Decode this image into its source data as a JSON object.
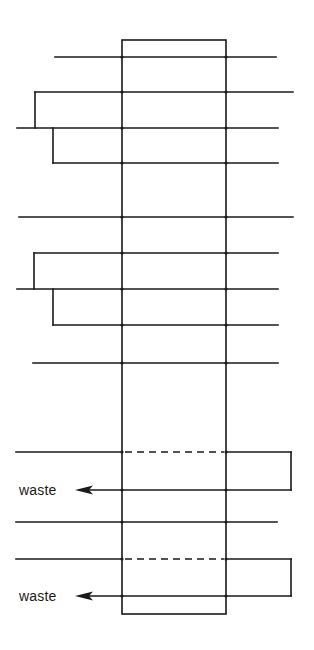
{
  "diagram": {
    "title": "",
    "canvas": {
      "width": 314,
      "height": 650
    },
    "colors": {
      "line": "#1a1a1a",
      "background": "#ffffff"
    },
    "box": {
      "x1": 122,
      "y1": 40,
      "x2": 226,
      "y2": 614
    },
    "lines": [
      {
        "id": "line-1",
        "y": 57,
        "x_start": 55,
        "x_end": 276
      },
      {
        "id": "line-2",
        "y": 92,
        "x_start": 35,
        "x_end": 293
      },
      {
        "id": "line-3",
        "y": 128,
        "x_start": 17,
        "x_end": 278
      },
      {
        "id": "line-4",
        "y": 163,
        "x_start": 53,
        "x_end": 278
      },
      {
        "id": "line-5",
        "y": 217,
        "x_start": 19,
        "x_end": 293
      },
      {
        "id": "line-6",
        "y": 253,
        "x_start": 34,
        "x_end": 278
      },
      {
        "id": "line-7",
        "y": 289,
        "x_start": 17,
        "x_end": 278
      },
      {
        "id": "line-8",
        "y": 325,
        "x_start": 53,
        "x_end": 278
      },
      {
        "id": "line-9",
        "y": 363,
        "x_start": 33,
        "x_end": 278
      },
      {
        "id": "line-11",
        "y": 522,
        "x_start": 16,
        "x_end": 277
      }
    ],
    "branches": [
      {
        "id": "branch-1",
        "x": 35,
        "y_from": 92,
        "y_to": 128
      },
      {
        "id": "branch-2",
        "x": 53,
        "y_from": 128,
        "y_to": 163
      },
      {
        "id": "branch-3",
        "x": 34,
        "y_from": 253,
        "y_to": 289
      },
      {
        "id": "branch-4",
        "x": 53,
        "y_from": 289,
        "y_to": 325
      }
    ],
    "loops": [
      {
        "id": "loop-1",
        "input_y": 452,
        "input_x_start": 16,
        "return_y": 490,
        "loop_x": 291,
        "dashed_inside_box": true,
        "arrow_tip_x": 75,
        "label": "waste"
      },
      {
        "id": "loop-2",
        "input_y": 559,
        "input_x_start": 16,
        "return_y": 596,
        "loop_x": 291,
        "dashed_inside_box": true,
        "arrow_tip_x": 75,
        "label": "waste"
      }
    ]
  },
  "labels": {
    "waste_1": "waste",
    "waste_2": "waste"
  }
}
